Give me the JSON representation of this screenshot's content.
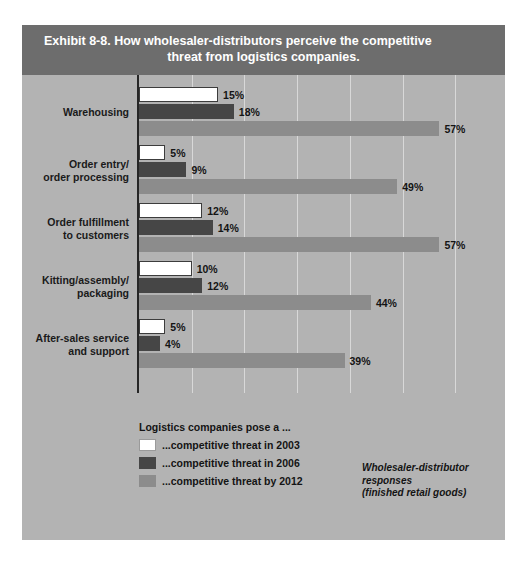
{
  "figure": {
    "title_line1": "Exhibit 8-8. How wholesaler-distributors perceive the competitive",
    "title_line2": "threat from logistics companies.",
    "note_line1": "Wholesaler-distributor responses",
    "note_line2": "(finished retail goods)",
    "legend_title": "Logistics companies pose a ...",
    "legend": [
      {
        "label": "...competitive threat in 2003",
        "color": "#ffffff"
      },
      {
        "label": "...competitive threat in 2006",
        "color": "#464646"
      },
      {
        "label": "...competitive threat by 2012",
        "color": "#8c8c8c"
      }
    ],
    "colors": {
      "panel_background": "#b3b3b3",
      "header_band": "#6d6d6d",
      "gridline": "#d8d8d8",
      "axis": "#262626"
    }
  },
  "chart_data": {
    "type": "bar",
    "orientation": "horizontal",
    "title": "Exhibit 8-8. How wholesaler-distributors perceive the competitive threat from logistics companies.",
    "xlabel": "",
    "ylabel": "",
    "xlim": [
      0,
      66
    ],
    "grid": true,
    "gridlines_at": [
      10,
      20,
      30,
      40,
      50,
      60
    ],
    "value_suffix": "%",
    "legend_position": "bottom-left",
    "categories": [
      "Warehousing",
      "Order entry/\norder processing",
      "Order fulfillment\nto customers",
      "Kitting/assembly/\npackaging",
      "After-sales service\nand support"
    ],
    "series": [
      {
        "name": "...competitive threat in 2003",
        "color": "#ffffff",
        "values": [
          15,
          5,
          12,
          10,
          5
        ]
      },
      {
        "name": "...competitive threat in 2006",
        "color": "#464646",
        "values": [
          18,
          9,
          14,
          12,
          4
        ]
      },
      {
        "name": "...competitive threat by 2012",
        "color": "#8c8c8c",
        "values": [
          57,
          49,
          57,
          44,
          39
        ]
      }
    ],
    "labels": [
      {
        "category": "Warehousing",
        "values": [
          "15%",
          "18%",
          "57%"
        ]
      },
      {
        "category": "Order entry/ order processing",
        "values": [
          "5%",
          "9%",
          "49%"
        ]
      },
      {
        "category": "Order fulfillment to customers",
        "values": [
          "12%",
          "14%",
          "57%"
        ]
      },
      {
        "category": "Kitting/assembly/ packaging",
        "values": [
          "10%",
          "12%",
          "44%"
        ]
      },
      {
        "category": "After-sales service and support",
        "values": [
          "5%",
          "4%",
          "39%"
        ]
      }
    ]
  }
}
